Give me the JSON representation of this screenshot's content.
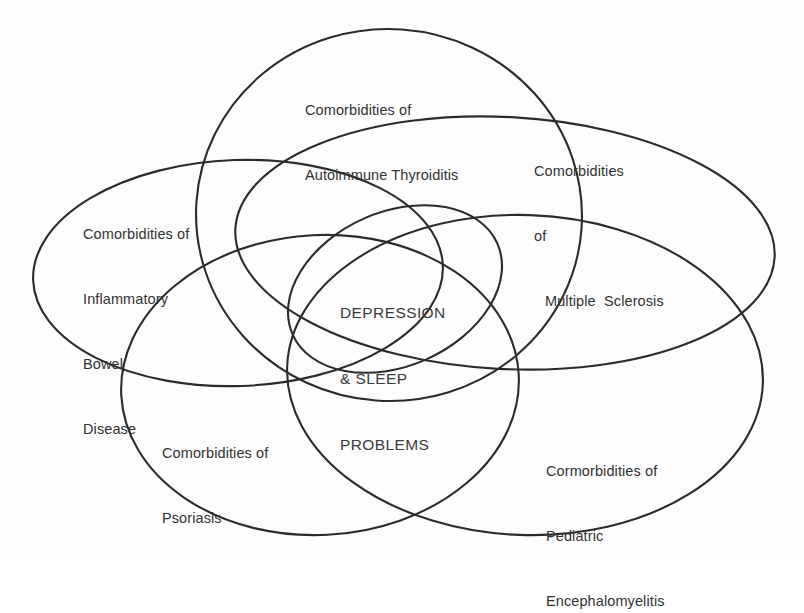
{
  "diagram": {
    "type": "venn",
    "background_color": "#fdfdfd",
    "stroke_color": "#2b2b2b",
    "text_color": "#333333",
    "center_text_color": "#3a3a3a",
    "center": {
      "line1": "DEPRESSION",
      "line2": "& SLEEP",
      "line3": "PROBLEMS"
    },
    "sets": {
      "thyroiditis": {
        "line1": "Comorbidities of",
        "line2": "Autoimmune Thyroiditis"
      },
      "multiple_sclerosis": {
        "line1": "Comorbidities",
        "line2": "of",
        "line3": "Multiple  Sclerosis"
      },
      "inflammatory_bowel_disease": {
        "line1": "Comorbidities of",
        "line2": "Inflammatory",
        "line3": "Bowel",
        "line4": "Disease"
      },
      "psoriasis": {
        "line1": "Comorbidities of",
        "line2": "Psoriasis"
      },
      "pediatric_encephalomyelitis": {
        "line1": "Cormorbidities of",
        "line2": "Pediatric",
        "line3": "Encephalomyelitis"
      }
    }
  }
}
